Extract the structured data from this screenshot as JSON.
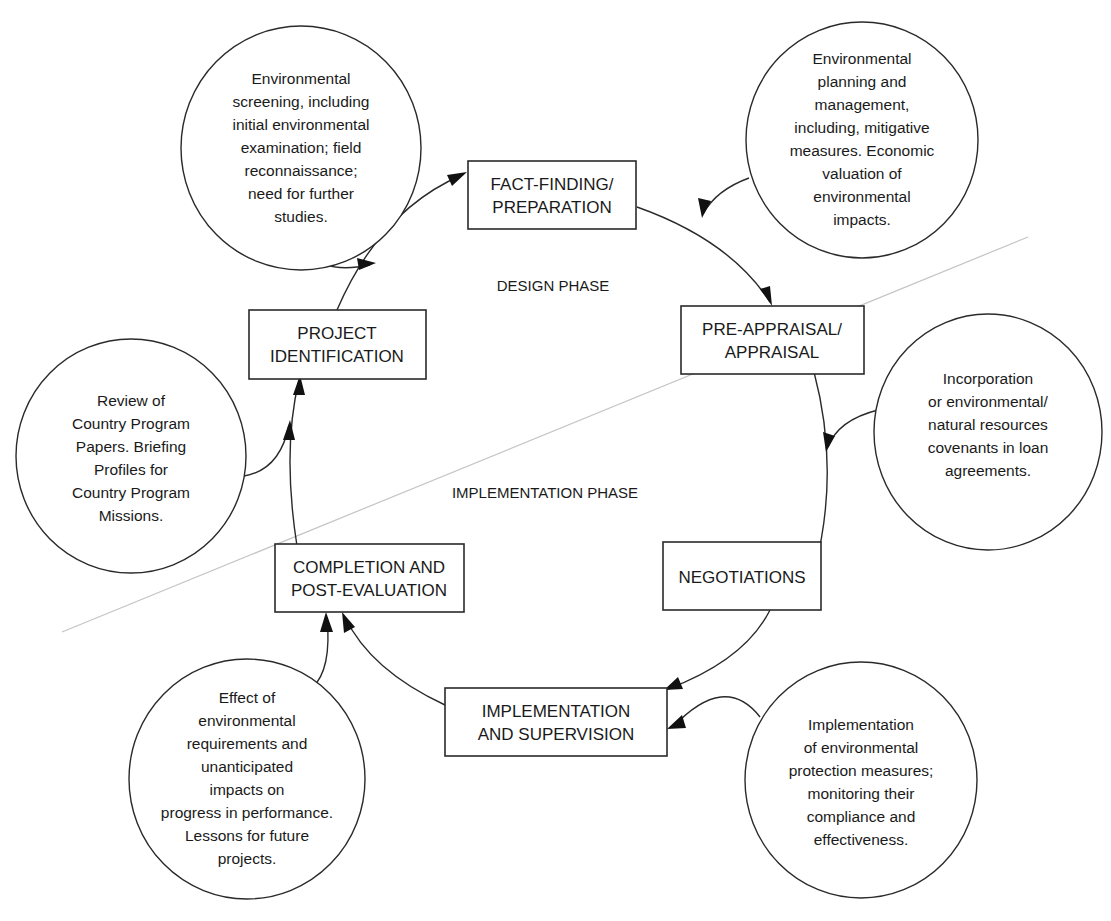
{
  "diagram": {
    "type": "project-cycle",
    "phases": {
      "design": "DESIGN PHASE",
      "implementation": "IMPLEMENTATION PHASE"
    },
    "stages": [
      {
        "id": "identification",
        "lines": [
          "PROJECT",
          "IDENTIFICATION"
        ]
      },
      {
        "id": "fact_finding",
        "lines": [
          "FACT-FINDING/",
          "PREPARATION"
        ]
      },
      {
        "id": "appraisal",
        "lines": [
          "PRE-APPRAISAL/",
          "APPRAISAL"
        ]
      },
      {
        "id": "negotiations",
        "lines": [
          "NEGOTIATIONS"
        ]
      },
      {
        "id": "implementation",
        "lines": [
          "IMPLEMENTATION",
          "AND SUPERVISION"
        ]
      },
      {
        "id": "completion",
        "lines": [
          "COMPLETION AND",
          "POST-EVALUATION"
        ]
      }
    ],
    "notes": [
      {
        "id": "screening",
        "target": "fact_finding",
        "lines": [
          "Environmental",
          "screening, including",
          "initial environmental",
          "examination; field",
          "reconnaissance;",
          "need for further",
          "studies."
        ]
      },
      {
        "id": "planning",
        "target": "appraisal",
        "lines": [
          "Environmental",
          "planning and",
          "management,",
          "including, mitigative",
          "measures. Economic",
          "valuation of",
          "environmental",
          "impacts."
        ]
      },
      {
        "id": "review",
        "target": "identification",
        "lines": [
          "Review of",
          "Country Program",
          "Papers. Briefing",
          "Profiles for",
          "Country Program",
          "Missions."
        ]
      },
      {
        "id": "covenants",
        "target": "negotiations",
        "lines": [
          "Incorporation",
          "or environmental/",
          "natural resources",
          "covenants in loan",
          "agreements."
        ]
      },
      {
        "id": "effect",
        "target": "completion",
        "lines": [
          "Effect of",
          "environmental",
          "requirements and",
          "unanticipated",
          "impacts on",
          "progress in performance.",
          "Lessons for future",
          "projects."
        ]
      },
      {
        "id": "protection",
        "target": "implementation",
        "lines": [
          "Implementation",
          "of environmental",
          "protection measures;",
          "monitoring their",
          "compliance and",
          "effectiveness."
        ]
      }
    ]
  }
}
